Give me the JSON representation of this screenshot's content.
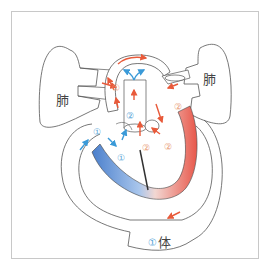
{
  "diagram": {
    "title": "",
    "labels": {
      "lung_left": "肺",
      "lung_right": "肺",
      "body": "体",
      "body_marker": "①"
    },
    "markers": [
      {
        "id": "m1",
        "text": "①",
        "color": "orange",
        "region": "pulmonary-artery-left"
      },
      {
        "id": "m2",
        "text": "②",
        "color": "blue",
        "region": "aortic-root"
      },
      {
        "id": "m3",
        "text": "②",
        "color": "orange",
        "region": "left-atrium"
      },
      {
        "id": "m4",
        "text": "①",
        "color": "blue",
        "region": "vena-cava"
      },
      {
        "id": "m5",
        "text": "①",
        "color": "blue",
        "region": "right-atrium"
      },
      {
        "id": "m6",
        "text": "②",
        "color": "orange",
        "region": "mitral-valve"
      },
      {
        "id": "m7",
        "text": "②",
        "color": "orange",
        "region": "left-ventricle-entry"
      }
    ],
    "colors": {
      "oxygenated": "#e8574a",
      "deoxygenated": "#4a86d0",
      "arrow_red": "#e85a3a",
      "arrow_blue": "#3a9ad8",
      "outline": "#555555",
      "frame": "#c8c8c8"
    }
  }
}
